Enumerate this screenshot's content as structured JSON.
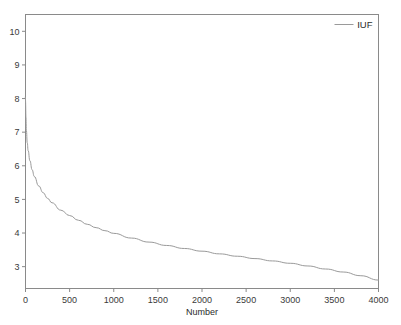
{
  "chart_data": {
    "type": "line",
    "title": "",
    "xlabel": "Number",
    "ylabel": "",
    "xlim": [
      0,
      4000
    ],
    "ylim": [
      2.35,
      10.5
    ],
    "grid": false,
    "legend_position": "top-right",
    "line_color": "#9a9a9a",
    "frame_color": "#8a8a8a",
    "background": "#ffffff",
    "xticks": [
      0,
      500,
      1000,
      1500,
      2000,
      2500,
      3000,
      3500,
      4000
    ],
    "xtick_labels": [
      "0",
      "500",
      "1000",
      "1500",
      "2000",
      "2500",
      "3000",
      "3500",
      "4000"
    ],
    "yticks": [
      3,
      4,
      5,
      6,
      7,
      8,
      9,
      10
    ],
    "ytick_labels": [
      "3",
      "4",
      "5",
      "6",
      "7",
      "8",
      "9",
      "10"
    ],
    "series": [
      {
        "name": "IUF",
        "color": "#9a9a9a",
        "x": [
          1,
          5,
          10,
          20,
          30,
          50,
          75,
          100,
          150,
          200,
          250,
          300,
          400,
          500,
          600,
          700,
          800,
          900,
          1000,
          1200,
          1400,
          1600,
          1800,
          2000,
          2200,
          2400,
          2600,
          2800,
          3000,
          3200,
          3400,
          3600,
          3800,
          4000
        ],
        "y": [
          8.05,
          7.45,
          7.05,
          6.68,
          6.45,
          6.15,
          5.88,
          5.68,
          5.4,
          5.2,
          5.03,
          4.9,
          4.68,
          4.52,
          4.38,
          4.26,
          4.16,
          4.07,
          3.99,
          3.85,
          3.73,
          3.63,
          3.54,
          3.46,
          3.38,
          3.31,
          3.24,
          3.17,
          3.1,
          3.02,
          2.93,
          2.84,
          2.73,
          2.6
        ]
      }
    ]
  },
  "legend": {
    "entries": [
      {
        "label": "IUF",
        "color": "#9a9a9a"
      }
    ]
  },
  "axes": {
    "x_title": "Number",
    "y_title": ""
  }
}
